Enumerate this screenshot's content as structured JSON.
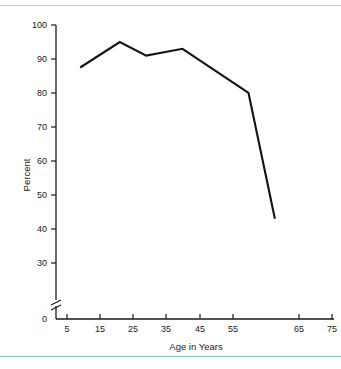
{
  "chart_data": {
    "type": "line",
    "title": "",
    "subtitle": "",
    "xlabel": "Age in Years",
    "ylabel": "Percent",
    "xlim": [
      0,
      77
    ],
    "ylim": [
      0,
      100
    ],
    "y_axis_break": true,
    "y_break_between": [
      0,
      27
    ],
    "grid": false,
    "legend": "none",
    "x_ticks": [
      5,
      15,
      25,
      35,
      45,
      55,
      65,
      75
    ],
    "x_tick_labels": [
      "5",
      "15",
      "25",
      "35",
      "45",
      "55",
      "65",
      "75"
    ],
    "y_ticks": [
      0,
      30,
      40,
      50,
      60,
      70,
      80,
      90,
      100
    ],
    "y_tick_labels": [
      "0",
      "30",
      "40",
      "50",
      "60",
      "70",
      "80",
      "90",
      "100"
    ],
    "series": [
      {
        "name": "Percent",
        "color": "#141414",
        "x": [
          9,
          21,
          29,
          40,
          60,
          68
        ],
        "values": [
          87.5,
          95,
          91,
          93,
          80,
          43
        ]
      }
    ]
  },
  "axis": {
    "y_label": "Percent",
    "x_label": "Age in Years",
    "y_tick_100": "100",
    "y_tick_90": "90",
    "y_tick_80": "80",
    "y_tick_70": "70",
    "y_tick_60": "60",
    "y_tick_50": "50",
    "y_tick_40": "40",
    "y_tick_30": "30",
    "y_tick_0": "0",
    "x_tick_5": "5",
    "x_tick_15": "15",
    "x_tick_25": "25",
    "x_tick_35": "35",
    "x_tick_45": "45",
    "x_tick_55": "55",
    "x_tick_65": "65",
    "x_tick_75": "75"
  },
  "style": {
    "line_color": "#141414",
    "axis_color": "#1a1a1a",
    "rule_top_color": "#bcd4d8",
    "rule_bottom_color": "#7ec4c4",
    "background": "#ffffff"
  }
}
